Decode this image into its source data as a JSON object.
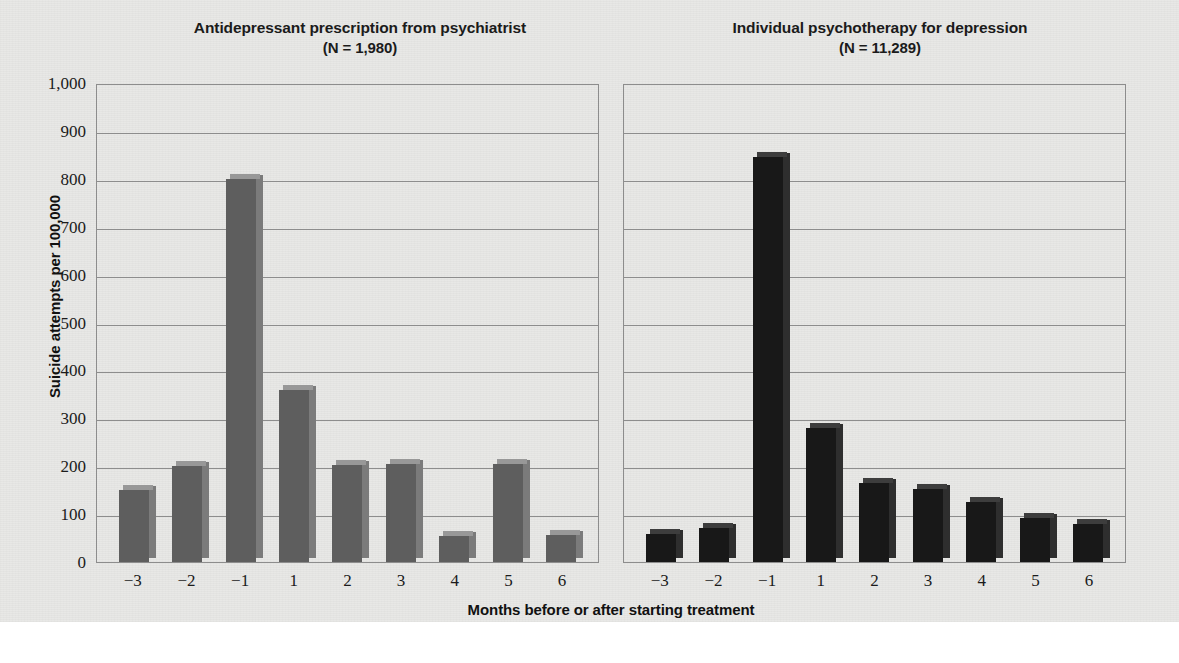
{
  "chart_data": {
    "type": "bar",
    "xlabel": "Months before or after starting treatment",
    "ylabel": "Suicide attempts per 100,000",
    "ylim": [
      0,
      1000
    ],
    "ytick_labels": [
      "1,000",
      "900",
      "800",
      "700",
      "600",
      "500",
      "400",
      "300",
      "200",
      "100",
      "0"
    ],
    "ytick_values": [
      1000,
      900,
      800,
      700,
      600,
      500,
      400,
      300,
      200,
      100,
      0
    ],
    "grid": "horizontal",
    "legend": "none",
    "categories": [
      "−3",
      "−2",
      "−1",
      "1",
      "2",
      "3",
      "4",
      "5",
      "6"
    ],
    "panels": [
      {
        "id": "antidepressant",
        "title_line1": "Antidepressant prescription from psychiatrist",
        "title_line2": "(N = 1,980)",
        "n": "1,980",
        "bar_color": "#5e5e5e",
        "values": [
          150,
          200,
          800,
          360,
          203,
          205,
          55,
          205,
          57
        ]
      },
      {
        "id": "psychotherapy",
        "title_line1": "Individual psychotherapy for depression",
        "title_line2": "(N = 11,289)",
        "n": "11,289",
        "bar_color": "#181818",
        "values": [
          58,
          72,
          845,
          280,
          165,
          152,
          125,
          92,
          80
        ]
      }
    ]
  },
  "credit": "© Cengage Learning 2013"
}
